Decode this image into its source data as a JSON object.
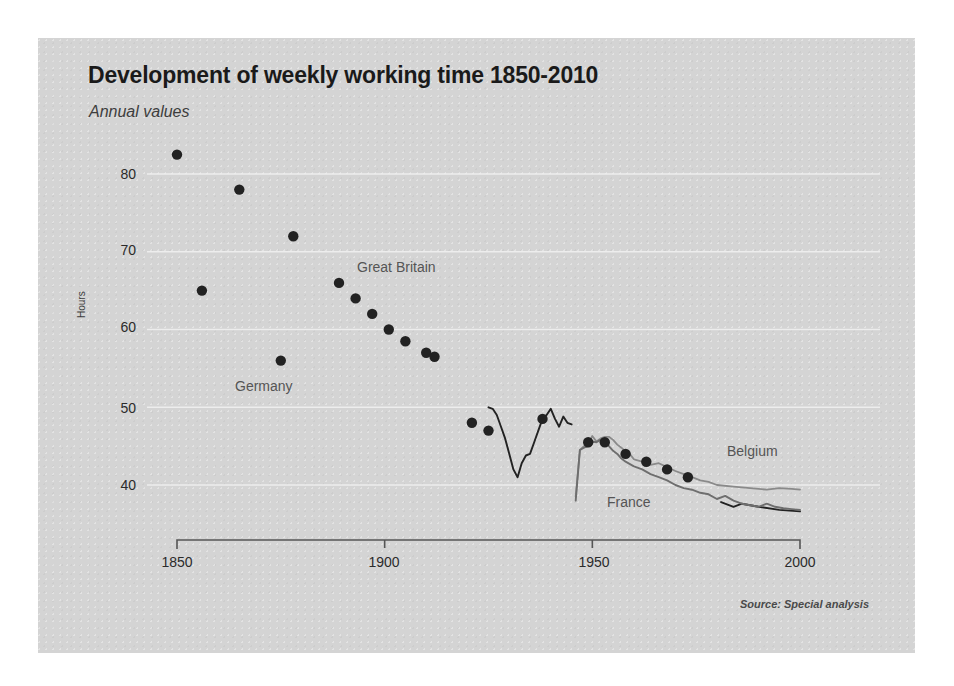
{
  "title": "Development of weekly working time 1850-2010",
  "subtitle": "Annual values",
  "source": "Source: Special analysis",
  "axis": {
    "ylabel": "Hours",
    "yticks": [
      "40",
      "50",
      "60",
      "70",
      "80"
    ],
    "xticks": [
      "1850",
      "1900",
      "1950",
      "2000"
    ]
  },
  "series_labels": {
    "great_britain": "Great Britain",
    "germany": "Germany",
    "belgium": "Belgium",
    "france": "France"
  },
  "colors": {
    "panel": "#d4d4d4",
    "gridline": "#f0f0f0",
    "axis": "#555555",
    "marker": "#222222",
    "germany_line": "#222222",
    "belgium_line": "#8a8a8a",
    "france_line": "#6e6e6e",
    "title": "#1a1a1a",
    "label": "#555555"
  },
  "chart_data": {
    "type": "scatter",
    "title": "Development of weekly working time 1850-2010",
    "subtitle": "Annual values",
    "xlabel": "",
    "ylabel": "Hours",
    "xlim": [
      1850,
      2000
    ],
    "ylim": [
      35,
      85
    ],
    "grid": "horizontal",
    "legend": "inline-annotations",
    "series": [
      {
        "name": "Great Britain",
        "type": "scatter",
        "marker": "filled-circle",
        "color": "#222222",
        "points": [
          {
            "x": 1850,
            "y": 82.5
          },
          {
            "x": 1856,
            "y": 65.0
          },
          {
            "x": 1865,
            "y": 78.0
          },
          {
            "x": 1875,
            "y": 56.0
          },
          {
            "x": 1878,
            "y": 72.0
          },
          {
            "x": 1889,
            "y": 66.0
          },
          {
            "x": 1893,
            "y": 64.0
          },
          {
            "x": 1897,
            "y": 62.0
          },
          {
            "x": 1901,
            "y": 60.0
          },
          {
            "x": 1905,
            "y": 58.5
          },
          {
            "x": 1910,
            "y": 57.0
          },
          {
            "x": 1912,
            "y": 56.5
          },
          {
            "x": 1921,
            "y": 48.0
          },
          {
            "x": 1925,
            "y": 47.0
          },
          {
            "x": 1938,
            "y": 48.5
          },
          {
            "x": 1949,
            "y": 45.5
          },
          {
            "x": 1953,
            "y": 45.5
          },
          {
            "x": 1958,
            "y": 44.0
          },
          {
            "x": 1963,
            "y": 43.0
          },
          {
            "x": 1968,
            "y": 42.0
          },
          {
            "x": 1973,
            "y": 41.0
          }
        ]
      },
      {
        "name": "Germany",
        "type": "line",
        "color": "#222222",
        "points": [
          {
            "x": 1925,
            "y": 50.0
          },
          {
            "x": 1926,
            "y": 49.8
          },
          {
            "x": 1927,
            "y": 49.0
          },
          {
            "x": 1928,
            "y": 47.5
          },
          {
            "x": 1929,
            "y": 46.0
          },
          {
            "x": 1930,
            "y": 44.0
          },
          {
            "x": 1931,
            "y": 42.0
          },
          {
            "x": 1932,
            "y": 41.0
          },
          {
            "x": 1933,
            "y": 42.8
          },
          {
            "x": 1934,
            "y": 43.8
          },
          {
            "x": 1935,
            "y": 44.0
          },
          {
            "x": 1936,
            "y": 45.5
          },
          {
            "x": 1937,
            "y": 47.0
          },
          {
            "x": 1938,
            "y": 48.5
          },
          {
            "x": 1939,
            "y": 49.0
          },
          {
            "x": 1940,
            "y": 49.8
          },
          {
            "x": 1941,
            "y": 48.5
          },
          {
            "x": 1942,
            "y": 47.5
          },
          {
            "x": 1943,
            "y": 48.8
          },
          {
            "x": 1944,
            "y": 48.0
          },
          {
            "x": 1945,
            "y": 47.8
          }
        ]
      },
      {
        "name": "Germany (post-war)",
        "type": "line",
        "color": "#222222",
        "points": [
          {
            "x": 1981,
            "y": 37.8
          },
          {
            "x": 1984,
            "y": 37.2
          },
          {
            "x": 1986,
            "y": 37.6
          },
          {
            "x": 1990,
            "y": 37.2
          },
          {
            "x": 1995,
            "y": 36.8
          },
          {
            "x": 2000,
            "y": 36.6
          }
        ]
      },
      {
        "name": "Belgium",
        "type": "line",
        "color": "#8a8a8a",
        "points": [
          {
            "x": 1946,
            "y": 38.5
          },
          {
            "x": 1947,
            "y": 44.5
          },
          {
            "x": 1948,
            "y": 45.0
          },
          {
            "x": 1949,
            "y": 45.2
          },
          {
            "x": 1950,
            "y": 46.3
          },
          {
            "x": 1951,
            "y": 45.6
          },
          {
            "x": 1952,
            "y": 46.0
          },
          {
            "x": 1953,
            "y": 46.2
          },
          {
            "x": 1954,
            "y": 46.2
          },
          {
            "x": 1955,
            "y": 45.8
          },
          {
            "x": 1956,
            "y": 45.2
          },
          {
            "x": 1957,
            "y": 44.8
          },
          {
            "x": 1958,
            "y": 44.3
          },
          {
            "x": 1959,
            "y": 44.0
          },
          {
            "x": 1960,
            "y": 43.3
          },
          {
            "x": 1962,
            "y": 43.0
          },
          {
            "x": 1964,
            "y": 42.6
          },
          {
            "x": 1966,
            "y": 42.8
          },
          {
            "x": 1968,
            "y": 42.3
          },
          {
            "x": 1970,
            "y": 41.8
          },
          {
            "x": 1972,
            "y": 41.4
          },
          {
            "x": 1974,
            "y": 41.0
          },
          {
            "x": 1976,
            "y": 40.6
          },
          {
            "x": 1978,
            "y": 40.4
          },
          {
            "x": 1980,
            "y": 40.0
          },
          {
            "x": 1984,
            "y": 39.8
          },
          {
            "x": 1988,
            "y": 39.6
          },
          {
            "x": 1992,
            "y": 39.4
          },
          {
            "x": 1995,
            "y": 39.6
          },
          {
            "x": 1998,
            "y": 39.5
          },
          {
            "x": 2000,
            "y": 39.4
          }
        ]
      },
      {
        "name": "France",
        "type": "line",
        "color": "#6e6e6e",
        "points": [
          {
            "x": 1946,
            "y": 38.0
          },
          {
            "x": 1947,
            "y": 44.5
          },
          {
            "x": 1948,
            "y": 44.8
          },
          {
            "x": 1949,
            "y": 45.0
          },
          {
            "x": 1950,
            "y": 45.6
          },
          {
            "x": 1951,
            "y": 45.5
          },
          {
            "x": 1952,
            "y": 45.8
          },
          {
            "x": 1953,
            "y": 45.6
          },
          {
            "x": 1954,
            "y": 45.0
          },
          {
            "x": 1955,
            "y": 44.4
          },
          {
            "x": 1956,
            "y": 44.0
          },
          {
            "x": 1957,
            "y": 43.4
          },
          {
            "x": 1958,
            "y": 43.0
          },
          {
            "x": 1960,
            "y": 42.4
          },
          {
            "x": 1962,
            "y": 42.0
          },
          {
            "x": 1964,
            "y": 41.4
          },
          {
            "x": 1966,
            "y": 41.0
          },
          {
            "x": 1968,
            "y": 40.6
          },
          {
            "x": 1970,
            "y": 40.0
          },
          {
            "x": 1972,
            "y": 39.6
          },
          {
            "x": 1974,
            "y": 39.4
          },
          {
            "x": 1976,
            "y": 39.0
          },
          {
            "x": 1978,
            "y": 38.8
          },
          {
            "x": 1980,
            "y": 38.2
          },
          {
            "x": 1982,
            "y": 38.6
          },
          {
            "x": 1984,
            "y": 38.0
          },
          {
            "x": 1986,
            "y": 37.6
          },
          {
            "x": 1988,
            "y": 37.4
          },
          {
            "x": 1990,
            "y": 37.2
          },
          {
            "x": 1992,
            "y": 37.6
          },
          {
            "x": 1994,
            "y": 37.2
          },
          {
            "x": 1996,
            "y": 37.0
          },
          {
            "x": 1998,
            "y": 36.9
          },
          {
            "x": 2000,
            "y": 36.8
          }
        ]
      }
    ]
  }
}
